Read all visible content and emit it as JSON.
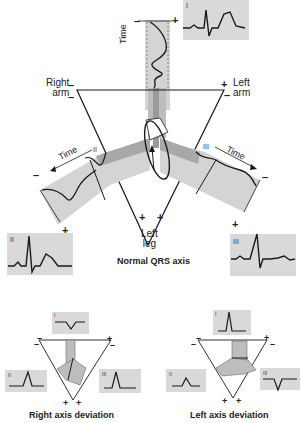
{
  "main_diagram": {
    "title": "Normal QRS axis",
    "vertices": {
      "right_arm": "Right\narm",
      "left_arm": "Left\narm",
      "left_leg": "Left\nleg"
    },
    "leads": [
      {
        "id": "I",
        "label": "I",
        "waveform": "positive-qrs-with-t"
      },
      {
        "id": "II",
        "label": "II",
        "waveform": "tall-positive-qrs-with-t"
      },
      {
        "id": "III",
        "label": "III",
        "waveform": "positive-qrs-small-t"
      }
    ],
    "time_label": "Time",
    "signs": {
      "plus": "+",
      "minus": "–"
    }
  },
  "sub_diagrams": [
    {
      "title": "Right axis deviation",
      "leads": [
        {
          "label": "I",
          "waveform": "negative-deflection"
        },
        {
          "label": "II",
          "waveform": "positive-deflection"
        },
        {
          "label": "III",
          "waveform": "tall-positive-deflection"
        }
      ]
    },
    {
      "title": "Left axis deviation",
      "leads": [
        {
          "label": "I",
          "waveform": "tall-positive-deflection"
        },
        {
          "label": "II",
          "waveform": "small-positive-deflection"
        },
        {
          "label": "III",
          "waveform": "negative-deflection"
        }
      ]
    }
  ],
  "colors": {
    "panel": "#d9d9d9",
    "band_light": "#d4d4d4",
    "band_dark": "#a8a8a8",
    "line": "#1a1a1a"
  }
}
